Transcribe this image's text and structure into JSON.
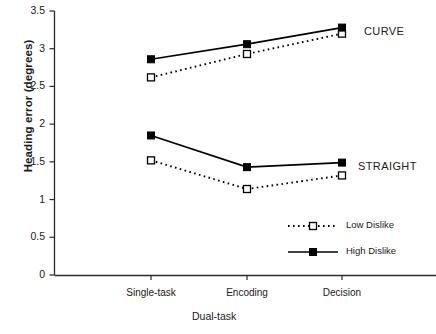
{
  "chart_data": {
    "type": "line",
    "title": "",
    "xlabel": "Dual-task",
    "ylabel": "Heading error (degrees)",
    "categories": [
      "Single-task",
      "Encoding",
      "Decision"
    ],
    "ylim": [
      0,
      3.5
    ],
    "yticks": [
      "0",
      "0.5",
      "1",
      "1.5",
      "2",
      "2.5",
      "3",
      "3.5"
    ],
    "grid": false,
    "legend_position": "inside-lower-right",
    "series": [
      {
        "name": "Low Dislike",
        "group": "CURVE",
        "line_style": "dotted",
        "marker": "open-square",
        "color": "#000000",
        "values": [
          2.62,
          2.93,
          3.2
        ]
      },
      {
        "name": "High Dislike",
        "group": "CURVE",
        "line_style": "solid",
        "marker": "filled-square",
        "color": "#000000",
        "values": [
          2.86,
          3.06,
          3.28
        ]
      },
      {
        "name": "Low Dislike",
        "group": "STRAIGHT",
        "line_style": "dotted",
        "marker": "open-square",
        "color": "#000000",
        "values": [
          1.52,
          1.14,
          1.32
        ]
      },
      {
        "name": "High Dislike",
        "group": "STRAIGHT",
        "line_style": "solid",
        "marker": "filled-square",
        "color": "#000000",
        "values": [
          1.85,
          1.43,
          1.49
        ]
      }
    ],
    "annotations": [
      {
        "text": "CURVE",
        "x": 364,
        "y": 25
      },
      {
        "text": "STRAIGHT",
        "x": 358,
        "y": 160
      }
    ],
    "legend": [
      {
        "label": "Low Dislike",
        "line_style": "dotted",
        "marker": "open-square"
      },
      {
        "label": "High Dislike",
        "line_style": "solid",
        "marker": "filled-square"
      }
    ]
  }
}
